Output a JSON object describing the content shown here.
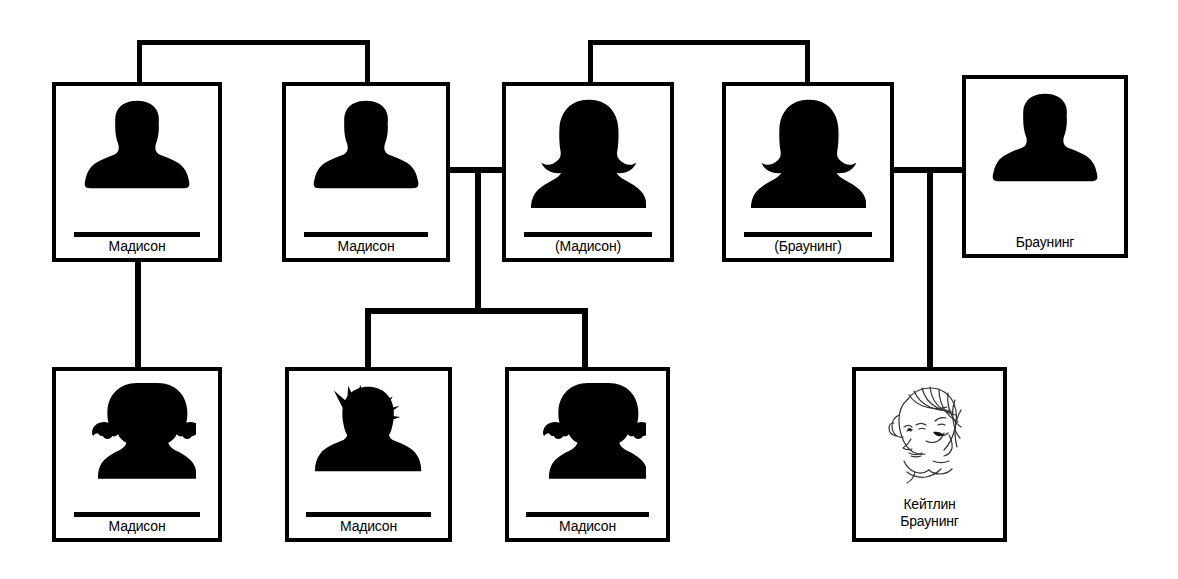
{
  "diagram": {
    "background": "#ffffff",
    "line_color": "#000000",
    "people": [
      {
        "id": "p1",
        "name": "Мадисон",
        "avatar": "man-silhouette-icon",
        "gender": "male",
        "underline": true,
        "x": 52,
        "y": 82,
        "w": 170,
        "h": 180
      },
      {
        "id": "p2",
        "name": "Мадисон",
        "avatar": "man-silhouette-icon",
        "gender": "male",
        "underline": true,
        "x": 282,
        "y": 82,
        "w": 168,
        "h": 180
      },
      {
        "id": "p3",
        "name": "(Мадисон)",
        "avatar": "woman-silhouette-icon",
        "gender": "female",
        "underline": true,
        "x": 502,
        "y": 82,
        "w": 172,
        "h": 180
      },
      {
        "id": "p4",
        "name": "(Браунинг)",
        "avatar": "woman-silhouette-icon",
        "gender": "female",
        "underline": true,
        "x": 722,
        "y": 82,
        "w": 172,
        "h": 180
      },
      {
        "id": "p5",
        "name": "Браунинг",
        "avatar": "man-silhouette-icon",
        "gender": "male",
        "underline": false,
        "x": 962,
        "y": 75,
        "w": 166,
        "h": 183
      },
      {
        "id": "p6",
        "name": "Мадисон",
        "avatar": "girl-pigtails-silhouette-icon",
        "gender": "female-child",
        "underline": true,
        "x": 52,
        "y": 367,
        "w": 170,
        "h": 175
      },
      {
        "id": "p7",
        "name": "Мадисон",
        "avatar": "boy-spiky-silhouette-icon",
        "gender": "male-child",
        "underline": true,
        "x": 285,
        "y": 367,
        "w": 167,
        "h": 175
      },
      {
        "id": "p8",
        "name": "Мадисон",
        "avatar": "girl-pigtails-silhouette-icon",
        "gender": "female-child",
        "underline": true,
        "x": 505,
        "y": 367,
        "w": 165,
        "h": 175
      },
      {
        "id": "p9",
        "name": "Кейтлин\nБраунинг",
        "avatar": "caitlin-portrait-sketch",
        "gender": "female-child",
        "underline": false,
        "x": 852,
        "y": 367,
        "w": 155,
        "h": 175
      }
    ],
    "connectors": [
      {
        "name": "sibling-bar-p1-p2",
        "type": "horizontal",
        "x": 137,
        "y": 40,
        "length": 233,
        "thickness": 5
      },
      {
        "name": "sibling-drop-p1",
        "type": "vertical",
        "x": 137,
        "y": 40,
        "length": 45,
        "thickness": 5
      },
      {
        "name": "sibling-drop-p2",
        "type": "vertical",
        "x": 365,
        "y": 40,
        "length": 45,
        "thickness": 5
      },
      {
        "name": "sibling-bar-p3-p4",
        "type": "horizontal",
        "x": 588,
        "y": 40,
        "length": 222,
        "thickness": 5
      },
      {
        "name": "sibling-drop-p3",
        "type": "vertical",
        "x": 588,
        "y": 40,
        "length": 45,
        "thickness": 5
      },
      {
        "name": "sibling-drop-p4",
        "type": "vertical",
        "x": 805,
        "y": 40,
        "length": 45,
        "thickness": 5
      },
      {
        "name": "marriage-bar-p2-p3",
        "type": "horizontal",
        "x": 450,
        "y": 167,
        "length": 55,
        "thickness": 6
      },
      {
        "name": "marriage-drop-p2-p3",
        "type": "vertical",
        "x": 475,
        "y": 167,
        "length": 145,
        "thickness": 6
      },
      {
        "name": "children-bar-p2-p3",
        "type": "horizontal",
        "x": 365,
        "y": 308,
        "length": 222,
        "thickness": 6
      },
      {
        "name": "children-drop-p7",
        "type": "vertical",
        "x": 365,
        "y": 308,
        "length": 62,
        "thickness": 6
      },
      {
        "name": "children-drop-p8",
        "type": "vertical",
        "x": 582,
        "y": 308,
        "length": 62,
        "thickness": 6
      },
      {
        "name": "child-drop-p1-to-p6",
        "type": "vertical",
        "x": 135,
        "y": 260,
        "length": 110,
        "thickness": 6
      },
      {
        "name": "marriage-bar-p4-p5",
        "type": "horizontal",
        "x": 892,
        "y": 167,
        "length": 73,
        "thickness": 6
      },
      {
        "name": "marriage-drop-p4-p5",
        "type": "vertical",
        "x": 927,
        "y": 167,
        "length": 202,
        "thickness": 6
      }
    ]
  }
}
